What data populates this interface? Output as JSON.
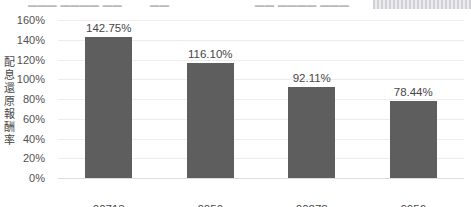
{
  "top_clipped_row": {
    "cell_a": "▁▁▁ ▁▁▁▁ ▁▁",
    "cell_b": "▁▁",
    "cell_c": "▁▁ ▁▁▁▁ ▁▁▁",
    "note": "cut-off row of text at the top edge of the capture (illegible)"
  },
  "colors": {
    "bar": "#5e5e5e",
    "gridline": "#ededf0",
    "baseline": "#dedee2",
    "text": "#464646",
    "background": "#ffffff"
  },
  "chart_data": {
    "type": "bar",
    "title": "",
    "subtitle": "",
    "xlabel": "",
    "ylabel": "配息還原報酬率",
    "categories": [
      "00713",
      "0050",
      "00878",
      "0056"
    ],
    "values": [
      142.75,
      116.1,
      92.11,
      78.44
    ],
    "value_labels": [
      "142.75%",
      "116.10%",
      "92.11%",
      "78.44%"
    ],
    "series": [
      {
        "name": "配息還原報酬率",
        "values": [
          142.75,
          116.1,
          92.11,
          78.44
        ]
      }
    ],
    "ylim": [
      0,
      160
    ],
    "ytick_step": 20,
    "ytick_labels": [
      "160%",
      "140%",
      "120%",
      "100%",
      "80%",
      "60%",
      "40%",
      "20%",
      "0%"
    ],
    "ytick_values": [
      160,
      140,
      120,
      100,
      80,
      60,
      40,
      20,
      0
    ],
    "grid": true,
    "grid_axis": "y",
    "legend": false,
    "legend_position": "none",
    "orientation": "vertical",
    "value_format": "percent",
    "bar_color": "#5e5e5e"
  }
}
